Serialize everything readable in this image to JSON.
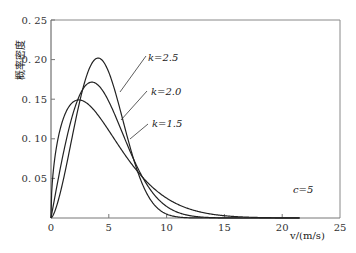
{
  "chart_data": {
    "type": "line",
    "title": "",
    "xlabel": "v/(m/s)",
    "ylabel": "概率密度",
    "xlim": [
      0,
      25
    ],
    "ylim": [
      0,
      0.25
    ],
    "x_ticks": [
      "0",
      "5",
      "10",
      "15",
      "20",
      "25"
    ],
    "y_ticks": [
      "0.05",
      "0.10",
      "0.15",
      "0.20",
      "0.25"
    ],
    "grid": false,
    "legend": "inline annotations with leader lines",
    "annotation": "c=5",
    "distribution": "Weibull, scale c=5",
    "x_max_drawn": 21.5,
    "series": [
      {
        "name": "k=2.5",
        "k": 2.5,
        "c": 5,
        "peak_x": 4.0,
        "peak_y": 0.2,
        "label": "k=2.5"
      },
      {
        "name": "k=2.0",
        "k": 2.0,
        "c": 5,
        "peak_x": 3.5,
        "peak_y": 0.17,
        "label": "k=2.0"
      },
      {
        "name": "k=1.5",
        "k": 1.5,
        "c": 5,
        "peak_x": 2.4,
        "peak_y": 0.148,
        "label": "k=1.5"
      }
    ]
  },
  "labels": {
    "k25": "k=2.5",
    "k20": "k=2.0",
    "k15": "k=1.5",
    "c": "c=5",
    "xlabel": "v/(m/s)",
    "ylabel": "概率密度"
  }
}
